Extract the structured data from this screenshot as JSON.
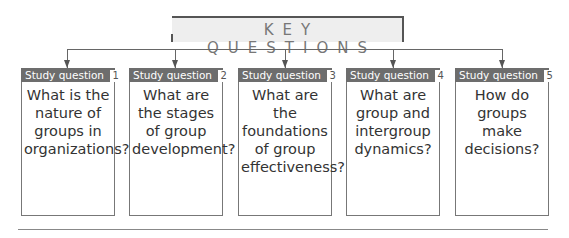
{
  "title": "KEY QUESTIONS",
  "colors": {
    "header_bg": "#6d6d6d",
    "title_bg": "#eeeeee",
    "line": "#666666"
  },
  "questions": [
    {
      "label": "Study question",
      "number": "1",
      "text": "What is the nature of groups in organizations?"
    },
    {
      "label": "Study question",
      "number": "2",
      "text": "What are the stages of group development?"
    },
    {
      "label": "Study question",
      "number": "3",
      "text": "What are the foundations of group effectiveness?"
    },
    {
      "label": "Study question",
      "number": "4",
      "text": "What are group and intergroup dynamics?"
    },
    {
      "label": "Study question",
      "number": "5",
      "text": "How do groups make decisions?"
    }
  ]
}
